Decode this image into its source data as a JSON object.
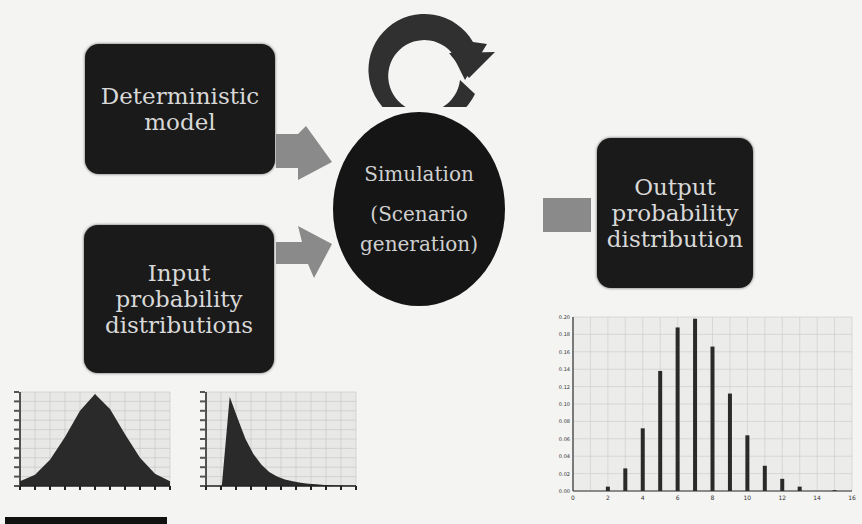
{
  "nodes": {
    "deterministic_model": "Deterministic model",
    "input_distributions": "Input probability distributions",
    "simulation_line1": "Simulation",
    "simulation_line2": "(Scenario generation)",
    "output_distribution": "Output probability distribution"
  },
  "icons": {
    "loop": "circular-refresh-arrow",
    "connector": "right-arrow"
  },
  "colors": {
    "box_fill": "#1a1a1a",
    "box_text": "#d8d8d8",
    "arrow_fill": "#8a8a8a",
    "background": "#f4f4f2"
  },
  "chart_data": [
    {
      "type": "area",
      "title": "Input distribution 1 (bell-shaped)",
      "x": [
        0,
        1,
        2,
        3,
        4,
        5,
        6,
        7,
        8,
        9,
        10
      ],
      "values": [
        0.05,
        0.12,
        0.28,
        0.52,
        0.8,
        0.98,
        0.82,
        0.55,
        0.3,
        0.13,
        0.05
      ],
      "grid": true
    },
    {
      "type": "area",
      "title": "Input distribution 2 (right-skewed)",
      "x": [
        0,
        1,
        2,
        3,
        4,
        5,
        6,
        7,
        8,
        9,
        10,
        11,
        12,
        13,
        14,
        15,
        16,
        17,
        18,
        19
      ],
      "values": [
        0,
        0,
        0,
        0.95,
        0.72,
        0.5,
        0.34,
        0.23,
        0.15,
        0.1,
        0.07,
        0.05,
        0.035,
        0.025,
        0.018,
        0.012,
        0.008,
        0.005,
        0.003,
        0.002
      ],
      "grid": true
    },
    {
      "type": "bar",
      "title": "Output probability distribution",
      "categories": [
        2,
        3,
        4,
        5,
        6,
        7,
        8,
        9,
        10,
        11,
        12,
        13,
        15
      ],
      "values": [
        0.005,
        0.026,
        0.072,
        0.138,
        0.188,
        0.198,
        0.166,
        0.112,
        0.064,
        0.029,
        0.014,
        0.005,
        0.001
      ],
      "xticks": [
        0,
        2,
        4,
        6,
        8,
        10,
        12,
        14,
        16
      ],
      "yticks": [
        "0.00",
        "0.02",
        "0.04",
        "0.06",
        "0.08",
        "0.10",
        "0.12",
        "0.14",
        "0.16",
        "0.18",
        "0.20"
      ],
      "ylim": [
        0,
        0.2
      ],
      "xlim": [
        0,
        16
      ],
      "grid": true
    }
  ]
}
